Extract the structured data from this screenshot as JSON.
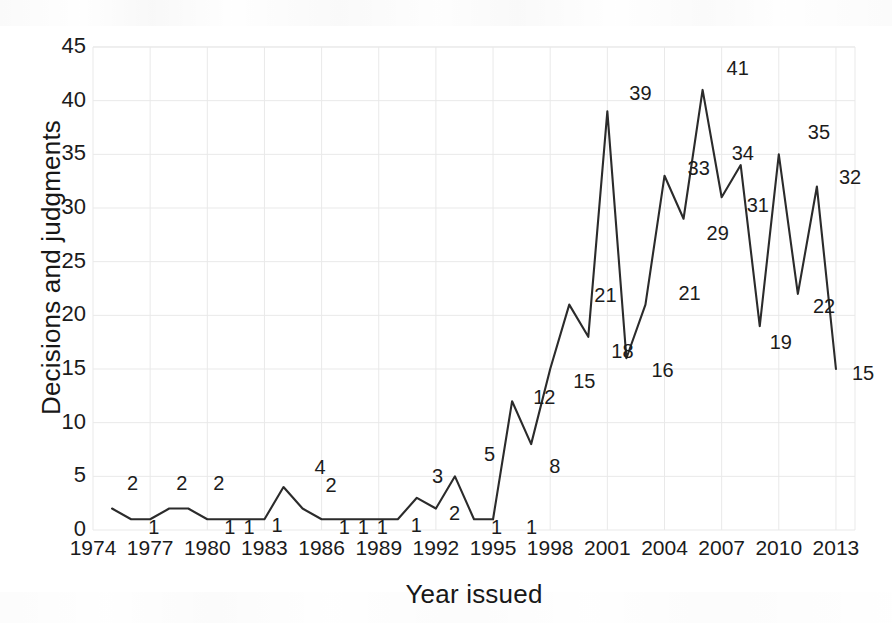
{
  "chart_data": {
    "type": "line",
    "title": "",
    "xlabel": "Year issued",
    "ylabel": "Decisions and judgments",
    "xlim": [
      1974,
      2014
    ],
    "ylim": [
      0,
      45
    ],
    "ytick_step": 5,
    "xtick_step": 3,
    "grid": true,
    "legend": "none",
    "line_color": "#2b2b2b",
    "grid_color": "#e9e9e9",
    "x": [
      1975,
      1976,
      1977,
      1978,
      1979,
      1980,
      1981,
      1982,
      1983,
      1984,
      1985,
      1986,
      1987,
      1988,
      1989,
      1990,
      1991,
      1992,
      1993,
      1994,
      1995,
      1996,
      1997,
      1998,
      1999,
      2000,
      2001,
      2002,
      2003,
      2004,
      2005,
      2006,
      2007,
      2008,
      2009,
      2010,
      2011,
      2012,
      2013
    ],
    "values": [
      2,
      1,
      1,
      2,
      2,
      1,
      1,
      1,
      1,
      4,
      2,
      1,
      1,
      1,
      1,
      1,
      3,
      2,
      5,
      1,
      1,
      12,
      8,
      15,
      21,
      18,
      39,
      16,
      21,
      33,
      29,
      41,
      31,
      34,
      19,
      35,
      22,
      32,
      15
    ],
    "ytick_labels": [
      "0",
      "5",
      "10",
      "15",
      "20",
      "25",
      "30",
      "35",
      "40",
      "45"
    ],
    "xtick_labels": [
      "1974",
      "1977",
      "1980",
      "1983",
      "1986",
      "1989",
      "1992",
      "1995",
      "1998",
      "2001",
      "2004",
      "2007",
      "2010",
      "2013"
    ],
    "point_labels": [
      {
        "text": "2",
        "year": 1976,
        "value": 2,
        "dx": -4,
        "dy": -26
      },
      {
        "text": "1",
        "year": 1977,
        "value": 1,
        "dx": -2,
        "dy": 8
      },
      {
        "text": "2",
        "year": 1979,
        "value": 2,
        "dx": -12,
        "dy": -26
      },
      {
        "text": "2",
        "year": 1980,
        "value": 2,
        "dx": 6,
        "dy": -26
      },
      {
        "text": "1",
        "year": 1981,
        "value": 1,
        "dx": -2,
        "dy": 8
      },
      {
        "text": "1",
        "year": 1982,
        "value": 1,
        "dx": -2,
        "dy": 8
      },
      {
        "text": "1",
        "year": 1984,
        "value": 1,
        "dx": -12,
        "dy": 6
      },
      {
        "text": "4",
        "year": 1985,
        "value": 4,
        "dx": 12,
        "dy": -20
      },
      {
        "text": "2",
        "year": 1986,
        "value": 2,
        "dx": 4,
        "dy": -24
      },
      {
        "text": "1",
        "year": 1987,
        "value": 1,
        "dx": -2,
        "dy": 8
      },
      {
        "text": "1",
        "year": 1988,
        "value": 1,
        "dx": -2,
        "dy": 8
      },
      {
        "text": "1",
        "year": 1989,
        "value": 1,
        "dx": -2,
        "dy": 8
      },
      {
        "text": "1",
        "year": 1991,
        "value": 1,
        "dx": -6,
        "dy": 6
      },
      {
        "text": "3",
        "year": 1992,
        "value": 3,
        "dx": -4,
        "dy": -22
      },
      {
        "text": "2",
        "year": 1993,
        "value": 2,
        "dx": -6,
        "dy": 4
      },
      {
        "text": "5",
        "year": 1994,
        "value": 5,
        "dx": 10,
        "dy": -22
      },
      {
        "text": "1",
        "year": 1995,
        "value": 1,
        "dx": -2,
        "dy": 8
      },
      {
        "text": "1",
        "year": 1996,
        "value": 1,
        "dx": 14,
        "dy": 8
      },
      {
        "text": "12",
        "year": 1997,
        "value": 12,
        "dx": 2,
        "dy": -4
      },
      {
        "text": "8",
        "year": 1997,
        "value": 8,
        "dx": 18,
        "dy": 22
      },
      {
        "text": "15",
        "year": 1999,
        "value": 15,
        "dx": 4,
        "dy": 12
      },
      {
        "text": "21",
        "year": 2000,
        "value": 21,
        "dx": 6,
        "dy": -10
      },
      {
        "text": "18",
        "year": 2001,
        "value": 18,
        "dx": 4,
        "dy": 14
      },
      {
        "text": "39",
        "year": 2001,
        "value": 39,
        "dx": 22,
        "dy": -18
      },
      {
        "text": "16",
        "year": 2003,
        "value": 16,
        "dx": 6,
        "dy": 12
      },
      {
        "text": "21",
        "year": 2004,
        "value": 21,
        "dx": 14,
        "dy": -12
      },
      {
        "text": "33",
        "year": 2005,
        "value": 33,
        "dx": 4,
        "dy": -8
      },
      {
        "text": "29",
        "year": 2006,
        "value": 29,
        "dx": 4,
        "dy": 14
      },
      {
        "text": "41",
        "year": 2006,
        "value": 41,
        "dx": 24,
        "dy": -22
      },
      {
        "text": "31",
        "year": 2008,
        "value": 31,
        "dx": 6,
        "dy": 8
      },
      {
        "text": "34",
        "year": 2009,
        "value": 34,
        "dx": -28,
        "dy": -12
      },
      {
        "text": "19",
        "year": 2009,
        "value": 19,
        "dx": 10,
        "dy": 16
      },
      {
        "text": "35",
        "year": 2011,
        "value": 35,
        "dx": 10,
        "dy": -22
      },
      {
        "text": "22",
        "year": 2012,
        "value": 22,
        "dx": -4,
        "dy": 12
      },
      {
        "text": "32",
        "year": 2012,
        "value": 32,
        "dx": 22,
        "dy": -10
      },
      {
        "text": "15",
        "year": 2013,
        "value": 15,
        "dx": 16,
        "dy": 4
      }
    ]
  }
}
